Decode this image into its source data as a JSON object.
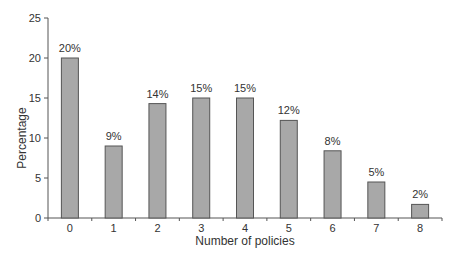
{
  "chart_data": {
    "type": "bar",
    "title": "",
    "xlabel": "Number of policies",
    "ylabel": "Percentage",
    "categories": [
      "0",
      "1",
      "2",
      "3",
      "4",
      "5",
      "6",
      "7",
      "8"
    ],
    "values": [
      20,
      9,
      14.3,
      15,
      15,
      12.2,
      8.4,
      4.5,
      1.7
    ],
    "data_labels": [
      "20%",
      "9%",
      "14%",
      "15%",
      "15%",
      "12%",
      "8%",
      "5%",
      "2%"
    ],
    "ylim": [
      0,
      25
    ],
    "yticks": [
      0,
      5,
      10,
      15,
      20,
      25
    ],
    "grid": false,
    "legend": null,
    "colors": {
      "bar_fill": "#a8a8a8",
      "bar_stroke": "#555555",
      "axis": "#555555",
      "text": "#333333"
    }
  }
}
